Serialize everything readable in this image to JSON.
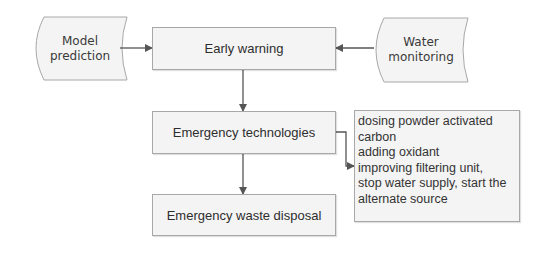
{
  "diagram": {
    "type": "flowchart",
    "colors": {
      "fill": "#f4f4f4",
      "border": "#a8a8a8",
      "arrow": "#555555",
      "text": "#333333"
    },
    "inputs": {
      "model_prediction": {
        "line1": "Model",
        "line2": "prediction",
        "shape": "stored-data"
      },
      "water_monitoring": {
        "line1": "Water",
        "line2": "monitoring",
        "shape": "stored-data"
      }
    },
    "process": {
      "early_warning": "Early warning",
      "emergency_technologies": "Emergency technologies",
      "emergency_waste_disposal": "Emergency waste disposal"
    },
    "technologies_notes": {
      "lines": [
        "dosing powder activated",
        "carbon",
        "adding oxidant",
        "improving filtering unit,",
        "stop water supply, start the",
        "alternate source"
      ]
    },
    "edges": [
      {
        "from": "Model prediction",
        "to": "Early warning"
      },
      {
        "from": "Water monitoring",
        "to": "Early warning"
      },
      {
        "from": "Early warning",
        "to": "Emergency technologies"
      },
      {
        "from": "Emergency technologies",
        "to": "Emergency waste disposal"
      },
      {
        "from": "Emergency technologies",
        "to": "technologies notes"
      }
    ]
  }
}
